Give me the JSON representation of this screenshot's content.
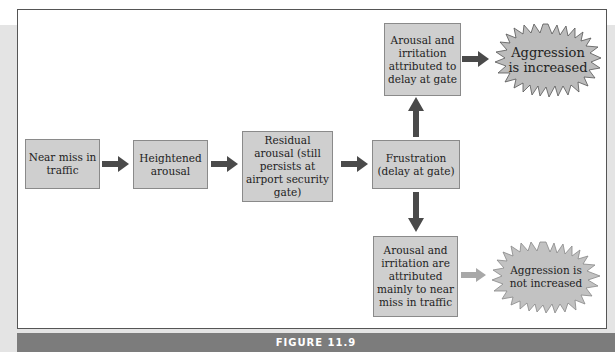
{
  "figure": {
    "caption": "FIGURE 11.9",
    "nodes": {
      "near_miss": "Near miss in traffic",
      "heightened": "Heightened arousal",
      "residual": "Residual arousal (still persists at airport security gate)",
      "frustration": "Frustration (delay at gate)",
      "attributed_gate": "Arousal and irritation attributed to delay at gate",
      "attributed_traffic": "Arousal and irritation are attributed mainly to near miss in traffic",
      "aggression_up": "Aggression is increased",
      "aggression_same": "Aggression is not increased"
    },
    "colors": {
      "box_fill": "#cfcfcf",
      "arrow_dark": "#4a4a4a",
      "arrow_light": "#a8a8a8",
      "caption_bar": "#7c7c7c"
    }
  }
}
